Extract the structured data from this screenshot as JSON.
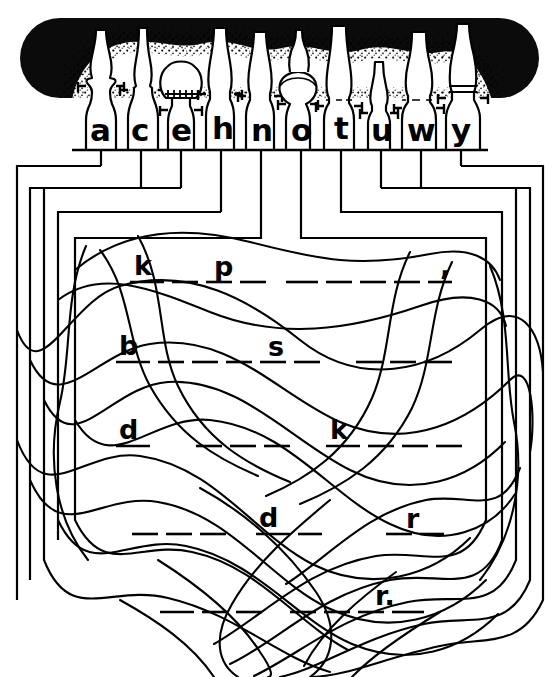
{
  "page": {
    "kind": "puzzle-worksheet",
    "width": 559,
    "height": 677,
    "ink_color": "#000000",
    "paper_color": "#ffffff"
  },
  "header_band": {
    "name": "oil-lamp-silhouette-band",
    "description": "Dark stippled rounded band with ten oil-lamp outlines",
    "band_color": "#0b0b0b",
    "lamp_count": 10,
    "lamp_fill": "#ffffff",
    "stipple": true
  },
  "alphabet_row": {
    "label": "letter-bottles",
    "letters": [
      "a",
      "c",
      "e",
      "h",
      "n",
      "o",
      "t",
      "u",
      "w",
      "y"
    ]
  },
  "bracket_tree": {
    "name": "nested-connector-brackets",
    "levels": 5,
    "description": "Vertical drops from each letter feeding nested rectangular brackets"
  },
  "puzzle_lines": [
    {
      "id": "line-1",
      "groups": [
        {
          "letter": "k",
          "blanks": 3
        },
        {
          "letter": "p",
          "blanks": 0
        }
      ],
      "tail_blanks": 6,
      "punctuation": ","
    },
    {
      "id": "line-2",
      "groups": [
        {
          "letter": "b",
          "blanks": 5
        },
        {
          "letter": "s",
          "blanks": 1
        }
      ],
      "tail_blanks": 4,
      "punctuation": ""
    },
    {
      "id": "line-3",
      "groups": [
        {
          "letter": "d",
          "blanks": 1
        },
        {
          "letter": "k",
          "blanks": 4
        }
      ],
      "mid_blanks": 3,
      "tail_blanks": 0,
      "punctuation": ""
    },
    {
      "id": "line-4",
      "lead_blanks": 3,
      "groups": [
        {
          "letter": "d",
          "blanks": 2
        },
        {
          "letter": "r",
          "blanks": 0
        }
      ],
      "lead_r_blanks": 1,
      "punctuation": ""
    },
    {
      "id": "line-5",
      "lead_blanks": 3,
      "mid_blanks": 4,
      "groups": [
        {
          "letter": "r",
          "blanks": 0
        }
      ],
      "punctuation": "."
    }
  ],
  "rendered_text": {
    "line1_left": "k",
    "line1_right": "p",
    "line1_punc": ",",
    "line2_left": "b",
    "line2_right": "s",
    "line3_left": "d",
    "line3_right": "k",
    "line4_mid": "d",
    "line4_right": "r",
    "line5_right": "r."
  },
  "letters": {
    "a": "a",
    "c": "c",
    "e": "e",
    "h": "h",
    "n": "n",
    "o": "o",
    "t": "t",
    "u": "u",
    "w": "w",
    "y": "y"
  }
}
